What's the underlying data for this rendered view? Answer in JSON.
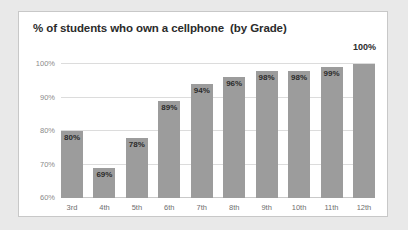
{
  "chart_data": {
    "type": "bar",
    "title": "% of students who own a cellphone  (by Grade)",
    "xlabel": "",
    "ylabel": "",
    "categories": [
      "3rd",
      "4th",
      "5th",
      "6th",
      "7th",
      "8th",
      "9th",
      "10th",
      "11th",
      "12th"
    ],
    "values": [
      80,
      69,
      78,
      89,
      94,
      96,
      98,
      98,
      99,
      100
    ],
    "data_labels": [
      "80%",
      "69%",
      "78%",
      "89%",
      "94%",
      "96%",
      "98%",
      "98%",
      "99%",
      "100%"
    ],
    "ylim": [
      60,
      100
    ],
    "yticks": [
      60,
      70,
      80,
      90,
      100
    ],
    "ytick_labels": [
      "60%",
      "70%",
      "80%",
      "90%",
      "100%"
    ],
    "grid": true,
    "legend": "none",
    "bar_color": "#9c9c9c",
    "label_color": "#2b2b2b",
    "grid_color": "#dcdcdc",
    "background": "#ffffff"
  }
}
